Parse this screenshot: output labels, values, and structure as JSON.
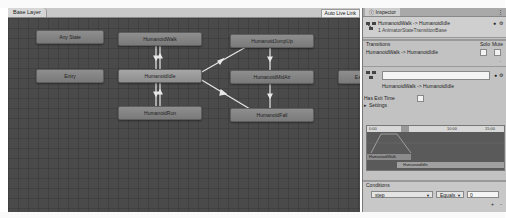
{
  "graph": {
    "layer_tab": "Base Layer",
    "auto_live_link": "Auto Live Link",
    "nodes": [
      {
        "label": "Any State",
        "x": 28,
        "y": 22,
        "w": 66
      },
      {
        "label": "Entry",
        "x": 28,
        "y": 61,
        "w": 66
      },
      {
        "label": "HumanoidWalk",
        "x": 118,
        "y": 24,
        "w": 80
      },
      {
        "label": "HumanoidIdle",
        "x": 110,
        "y": 61,
        "w": 82
      },
      {
        "label": "HumanoidRun",
        "x": 110,
        "y": 98,
        "w": 82
      },
      {
        "label": "HumanoidJumpUp",
        "x": 222,
        "y": 26,
        "w": 82
      },
      {
        "label": "HumanoidMidAir",
        "x": 222,
        "y": 62,
        "w": 82
      },
      {
        "label": "HumanoidFall",
        "x": 222,
        "y": 100,
        "w": 82
      },
      {
        "label": "Exit",
        "x": 350,
        "y": 62,
        "w": 40
      }
    ]
  },
  "inspector": {
    "tab_label": "Inspector",
    "header_title": "HumanoidWalk -> HumanoidIdle",
    "header_sub": "1 AnimatorStateTransitionBase",
    "transitions_label": "Transitions",
    "solo_label": "Solo",
    "mute_label": "Mute",
    "transition_item": "HumanoidWalk -> HumanoidIdle",
    "name_field_value": "",
    "transition_caption": "HumanoidWalk -> HumanoidIdle",
    "has_exit_time_label": "Has Exit Time",
    "settings_label": "Settings",
    "ruler_ticks": [
      "0:00",
      "",
      "10:00",
      "15:00"
    ],
    "clip_a": "HumanoidWalk",
    "clip_b": "HumanoidIdle",
    "conditions_label": "Conditions",
    "condition": {
      "parameter": "step",
      "mode": "Equals",
      "value": "0"
    },
    "add_label": "+",
    "remove_label": "-"
  },
  "colors": {
    "graph_bg": "#4a4a4a",
    "node": "#858585",
    "edge": "#e8e8e8",
    "inspector_bg": "#c2c2c2"
  }
}
